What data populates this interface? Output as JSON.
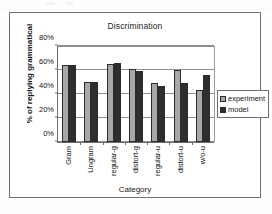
{
  "chart_data": {
    "type": "bar",
    "title": "Discrimination",
    "xlabel": "Category",
    "ylabel": "% of replying grammatical",
    "categories": [
      "Gram",
      "Ungram",
      "regular-g",
      "distort-g",
      "regular-u",
      "distort-u",
      "w/o-u"
    ],
    "series": [
      {
        "name": "experiment",
        "color": "#a8a8a8",
        "values": [
          64,
          50,
          65,
          61,
          49,
          60,
          43
        ]
      },
      {
        "name": "model",
        "color": "#2e2e2e",
        "values": [
          64,
          50,
          66,
          59,
          47,
          49,
          56
        ]
      }
    ],
    "ylim": [
      0,
      80
    ],
    "yticks": [
      0,
      20,
      40,
      60,
      80
    ],
    "ytick_labels": [
      "0%",
      "20%",
      "40%",
      "60%",
      "80%"
    ],
    "grid": true,
    "legend_position": "right"
  }
}
